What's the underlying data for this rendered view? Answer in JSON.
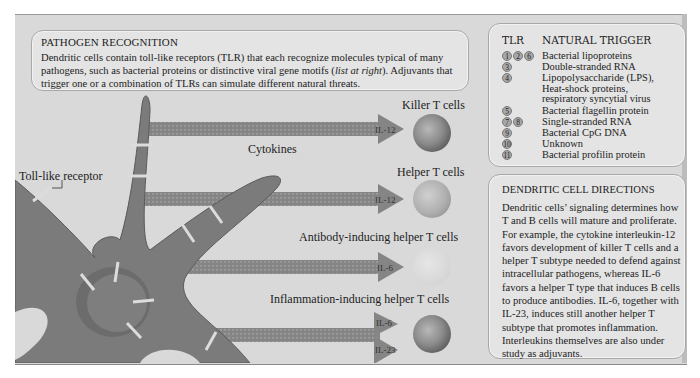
{
  "pathogen_box": {
    "title": "PATHOGEN RECOGNITION",
    "text_before_italic": "Dendritic cells contain toll-like receptors (TLR) that each recognize molecules typical of many pathogens, such as bacterial proteins or distinctive viral gene motifs (",
    "italic": "list at right",
    "text_after_italic": "). Adjuvants that trigger one or a combination of TLRs can simulate different natural threats."
  },
  "tlr_table": {
    "headers": {
      "tlr": "TLR",
      "trigger": "NATURAL TRIGGER"
    },
    "rows": [
      {
        "tlrs": [
          "1",
          "2",
          "6"
        ],
        "trigger": "Bacterial lipoproteins"
      },
      {
        "tlrs": [
          "3"
        ],
        "trigger": "Double-stranded RNA"
      },
      {
        "tlrs": [
          "4"
        ],
        "trigger": "Lipopolysaccharide (LPS),\nHeat-shock proteins,\nrespiratory syncytial virus"
      },
      {
        "tlrs": [
          "5"
        ],
        "trigger": "Bacterial flagellin protein"
      },
      {
        "tlrs": [
          "7",
          "8"
        ],
        "trigger": "Single-stranded RNA"
      },
      {
        "tlrs": [
          "9"
        ],
        "trigger": "Bacterial CpG DNA"
      },
      {
        "tlrs": [
          "10"
        ],
        "trigger": "Unknown"
      },
      {
        "tlrs": [
          "11"
        ],
        "trigger": "Bacterial profilin protein"
      }
    ]
  },
  "directions_box": {
    "title": "DENDRITIC CELL DIRECTIONS",
    "text": "Dendritic cells’ signaling determines how T and B cells will mature and proliferate. For example, the cytokine interleukin-12 favors development of killer T cells and a helper T subtype needed to defend against intracellular pathogens, whereas IL-6 favors a helper T type that induces B cells to produce antibodies. IL-6, together with IL-23, induces still another helper T subtype that promotes inflammation. Interleukins themselves are also under study as adjuvants."
  },
  "diagram": {
    "receptor_label": "Toll-like receptor",
    "cytokines_label": "Cytokines",
    "targets": [
      {
        "name": "Killer T cells",
        "signals": [
          "IL-12"
        ],
        "color": "#8a8a8a"
      },
      {
        "name": "Helper T cells",
        "signals": [
          "IL-12"
        ],
        "color": "#b0b0b0"
      },
      {
        "name": "Antibody-inducing helper T cells",
        "signals": [
          "IL-6"
        ],
        "color": "#dcdcdc"
      },
      {
        "name": "Inflammation-inducing helper T cells",
        "signals": [
          "IL-6",
          "IL-23"
        ],
        "color": "#8a8a8a"
      }
    ],
    "colors": {
      "cell_body": "#7b7b7b",
      "arrow": "#858585",
      "background": "#d9d9d9",
      "box": "#e4e4e4"
    }
  }
}
